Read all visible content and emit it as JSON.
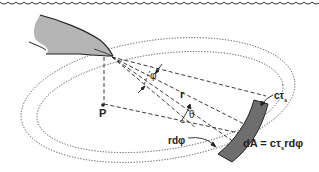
{
  "diagram": {
    "labels": {
      "point": "P",
      "range": "r",
      "beam_angle": "φ",
      "grazing_angle": "θ",
      "arc_length": "rdφ",
      "pulse_depth": "cτ",
      "pulse_sub": "s",
      "area_eq_prefix": "dA = cτ",
      "area_eq_sub": "s",
      "area_eq_suffix": "rdφ"
    },
    "elements": {
      "surface": "wavy water surface line",
      "animal": "dolphin head",
      "rings": "two dotted concentric ellipses",
      "beam": "dashed rays from dolphin melon",
      "patch": "shaded annular sector dA"
    },
    "colors": {
      "ink": "#222222",
      "dolphin_fill": "#b5b5b5",
      "patch_fill": "#6e6e6e",
      "background": "#ffffff"
    }
  }
}
